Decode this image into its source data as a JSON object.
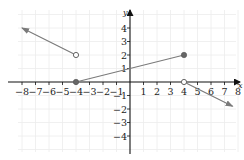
{
  "chart_data": {
    "type": "line",
    "title": "",
    "xlabel": "x",
    "ylabel": "y",
    "xlim": [
      -9,
      8.3
    ],
    "ylim": [
      -5.8,
      5.9
    ],
    "grid": true,
    "x_ticks": [
      -8,
      -7,
      -6,
      -5,
      -4,
      -3,
      -2,
      -1,
      1,
      2,
      3,
      4,
      5,
      6,
      7,
      8
    ],
    "y_ticks": [
      -4,
      -3,
      -2,
      -1,
      1,
      2,
      3,
      4
    ],
    "x_tick_labels": [
      "−8",
      "−7",
      "−6",
      "−5",
      "−4",
      "−3",
      "−2",
      "−1",
      "1",
      "2",
      "3",
      "4",
      "5",
      "6",
      "7",
      "8"
    ],
    "y_tick_labels": [
      "−4",
      "−3",
      "−2",
      "−1",
      "1",
      "2",
      "3",
      "4"
    ],
    "colors": {
      "line": "#7a7a7a",
      "axis": "#111111",
      "grid": "#ececec"
    },
    "series": [
      {
        "name": "left-ray",
        "points": [
          [
            -4,
            2
          ],
          [
            -8,
            4
          ]
        ],
        "start_marker": "open",
        "end_marker": "arrow"
      },
      {
        "name": "middle-segment",
        "points": [
          [
            -4,
            0
          ],
          [
            4,
            2
          ]
        ],
        "start_marker": "closed",
        "end_marker": "closed"
      },
      {
        "name": "right-ray",
        "points": [
          [
            4,
            0
          ],
          [
            7.6,
            -1.8
          ]
        ],
        "start_marker": "open",
        "end_marker": "arrow"
      }
    ]
  }
}
